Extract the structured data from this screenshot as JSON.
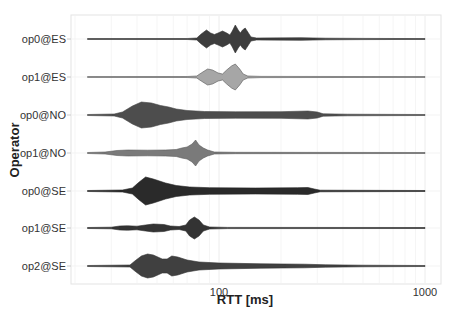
{
  "chart_data": {
    "type": "violin",
    "title": "",
    "xlabel": "RTT [ms]",
    "ylabel": "Operator",
    "x_scale": "log10",
    "xlim": [
      15,
      1300
    ],
    "x_ticks": [
      {
        "value": 100,
        "label": "100"
      },
      {
        "value": 1000,
        "label": "1000"
      }
    ],
    "grid": true,
    "legend": "none",
    "categories": [
      "op0@ES",
      "op1@ES",
      "op0@NO",
      "op1@NO",
      "op0@SE",
      "op1@SE",
      "op2@SE"
    ],
    "series": [
      {
        "name": "op0@ES",
        "fill": "#3d3d3d",
        "stroke": "#333333",
        "range_ms": [
          23,
          1000
        ],
        "profile": [
          [
            23,
            0.4
          ],
          [
            70,
            0.5
          ],
          [
            78,
            1
          ],
          [
            82,
            5
          ],
          [
            87,
            9
          ],
          [
            91,
            6
          ],
          [
            95,
            4.5
          ],
          [
            99,
            6
          ],
          [
            104,
            8
          ],
          [
            109,
            6
          ],
          [
            113,
            4
          ],
          [
            116,
            8
          ],
          [
            120,
            14
          ],
          [
            124,
            9
          ],
          [
            127,
            6
          ],
          [
            130,
            9
          ],
          [
            134,
            11
          ],
          [
            138,
            7
          ],
          [
            143,
            2
          ],
          [
            152,
            1
          ],
          [
            250,
            1.3
          ],
          [
            330,
            0.8
          ],
          [
            500,
            0.6
          ],
          [
            1000,
            0.4
          ]
        ]
      },
      {
        "name": "op1@ES",
        "fill": "#a6a6a6",
        "stroke": "#555555",
        "range_ms": [
          23,
          1000
        ],
        "profile": [
          [
            23,
            0.4
          ],
          [
            70,
            0.5
          ],
          [
            78,
            1
          ],
          [
            82,
            4
          ],
          [
            88,
            8
          ],
          [
            93,
            7
          ],
          [
            99,
            4
          ],
          [
            104,
            3
          ],
          [
            109,
            7
          ],
          [
            115,
            11
          ],
          [
            120,
            13
          ],
          [
            126,
            8
          ],
          [
            131,
            3
          ],
          [
            138,
            1
          ],
          [
            160,
            0.6
          ],
          [
            1000,
            0.4
          ]
        ]
      },
      {
        "name": "op0@NO",
        "fill": "#4d4d4d",
        "stroke": "#444444",
        "range_ms": [
          23,
          1000
        ],
        "profile": [
          [
            23,
            0.5
          ],
          [
            31,
            1
          ],
          [
            34,
            3
          ],
          [
            38,
            9
          ],
          [
            42,
            13
          ],
          [
            47,
            12
          ],
          [
            52,
            9.5
          ],
          [
            57,
            8
          ],
          [
            62,
            6
          ],
          [
            70,
            4.5
          ],
          [
            85,
            3.5
          ],
          [
            120,
            3.2
          ],
          [
            200,
            3.3
          ],
          [
            270,
            4
          ],
          [
            300,
            3
          ],
          [
            320,
            1.2
          ],
          [
            420,
            0.8
          ],
          [
            1000,
            0.5
          ]
        ]
      },
      {
        "name": "op1@NO",
        "fill": "#7a7a7a",
        "stroke": "#5a5a5a",
        "range_ms": [
          23,
          1000
        ],
        "profile": [
          [
            23,
            0.5
          ],
          [
            28,
            1
          ],
          [
            32,
            2.5
          ],
          [
            36,
            3
          ],
          [
            45,
            2.8
          ],
          [
            55,
            3
          ],
          [
            62,
            3.5
          ],
          [
            66,
            5
          ],
          [
            70,
            6
          ],
          [
            74,
            9
          ],
          [
            77,
            13
          ],
          [
            80,
            8
          ],
          [
            84,
            5
          ],
          [
            88,
            3
          ],
          [
            95,
            1
          ],
          [
            120,
            0.7
          ],
          [
            1000,
            0.5
          ]
        ]
      },
      {
        "name": "op0@SE",
        "fill": "#2a2a2a",
        "stroke": "#222222",
        "range_ms": [
          23,
          1000
        ],
        "profile": [
          [
            23,
            0.5
          ],
          [
            34,
            1
          ],
          [
            38,
            3
          ],
          [
            41,
            9
          ],
          [
            44,
            14
          ],
          [
            48,
            12
          ],
          [
            55,
            8
          ],
          [
            62,
            5.5
          ],
          [
            72,
            4
          ],
          [
            90,
            3.3
          ],
          [
            150,
            3
          ],
          [
            240,
            3.3
          ],
          [
            270,
            3.5
          ],
          [
            290,
            2
          ],
          [
            310,
            0.8
          ],
          [
            1000,
            0.5
          ]
        ]
      },
      {
        "name": "op1@SE",
        "fill": "#333333",
        "stroke": "#2a2a2a",
        "range_ms": [
          23,
          1000
        ],
        "profile": [
          [
            23,
            0.5
          ],
          [
            30,
            0.8
          ],
          [
            33,
            2
          ],
          [
            36,
            2.2
          ],
          [
            40,
            1.8
          ],
          [
            44,
            3
          ],
          [
            48,
            4
          ],
          [
            54,
            3.5
          ],
          [
            58,
            2
          ],
          [
            64,
            1.5
          ],
          [
            69,
            3
          ],
          [
            72,
            8
          ],
          [
            76,
            11
          ],
          [
            80,
            8
          ],
          [
            84,
            3
          ],
          [
            90,
            1
          ],
          [
            110,
            0.6
          ],
          [
            1000,
            0.5
          ]
        ]
      },
      {
        "name": "op2@SE",
        "fill": "#404040",
        "stroke": "#333333",
        "range_ms": [
          23,
          1000
        ],
        "profile": [
          [
            23,
            0.5
          ],
          [
            37,
            1
          ],
          [
            39,
            5
          ],
          [
            42,
            10
          ],
          [
            45,
            12
          ],
          [
            48,
            11
          ],
          [
            53,
            7
          ],
          [
            56,
            7
          ],
          [
            59,
            10
          ],
          [
            63,
            9
          ],
          [
            70,
            6
          ],
          [
            80,
            4
          ],
          [
            100,
            3
          ],
          [
            160,
            2.2
          ],
          [
            260,
            1.8
          ],
          [
            330,
            1.2
          ],
          [
            500,
            0.8
          ],
          [
            1000,
            0.5
          ]
        ]
      }
    ]
  }
}
